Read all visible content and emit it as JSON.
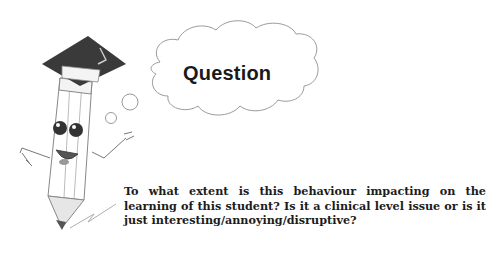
{
  "cloud": {
    "label": "Question"
  },
  "body": {
    "question": "To what extent is this behaviour impacting on the learning of this student? Is it a clinical level issue or is it just interesting/annoying/disruptive?"
  },
  "colors": {
    "text": "#1c1c1c",
    "cap": "#3a3a3a",
    "outline": "#8a8a8a",
    "pencil_tip": "#555555"
  }
}
